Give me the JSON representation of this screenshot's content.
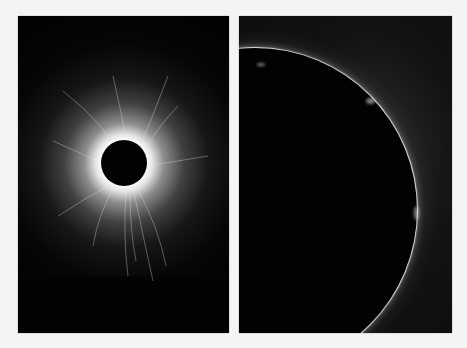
{
  "image": {
    "description": "Two side-by-side photographs of a total solar eclipse on a light gray background",
    "background_color": "#f4f4f4",
    "panels": [
      {
        "id": "left",
        "subject": "Total solar eclipse with full white corona and radial streamers around the dark lunar disk",
        "colors": {
          "sky": "#030303",
          "corona": "#ffffff",
          "moon": "#020202"
        }
      },
      {
        "id": "right",
        "subject": "Close-up of the lunar disk edge during totality showing the thin bright chromosphere rim and small prominences",
        "colors": {
          "sky": "#0c0c0c",
          "rim": "#e8e8e8",
          "moon": "#020202"
        }
      }
    ]
  }
}
